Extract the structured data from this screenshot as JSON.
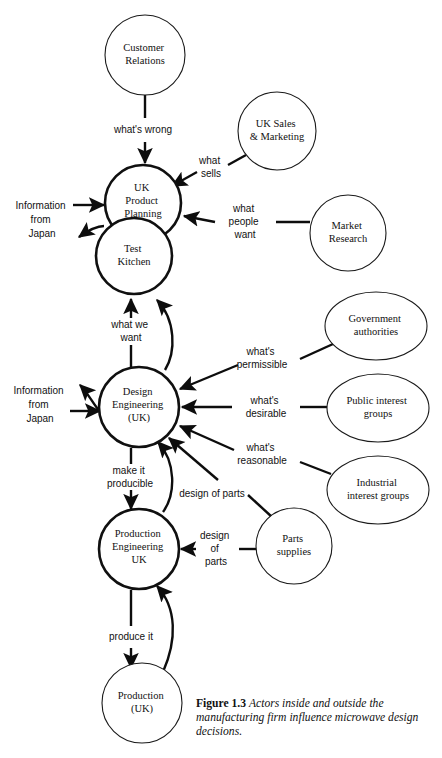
{
  "figure": {
    "label": "Figure 1.3",
    "caption": "Actors inside and outside the manufacturing firm influence microwave design decisions."
  },
  "diagram": {
    "type": "actor-influence-diagram",
    "stroke_color": "#101010",
    "background": "#ffffff",
    "internal_stroke_width": 2.6,
    "external_stroke_width": 1.1,
    "nodes": [
      {
        "id": "customer-relations",
        "label_lines": [
          "Customer",
          "Relations"
        ],
        "shape": "circle",
        "scope": "external",
        "cx": 145,
        "cy": 55,
        "r": 40
      },
      {
        "id": "uk-sales-marketing",
        "label_lines": [
          "UK Sales",
          "& Marketing"
        ],
        "shape": "circle",
        "scope": "external",
        "cx": 277,
        "cy": 131,
        "r": 39
      },
      {
        "id": "uk-product-planning",
        "label_lines": [
          "UK",
          "Product",
          "Planning"
        ],
        "shape": "circle",
        "scope": "internal",
        "cx": 143,
        "cy": 203,
        "r": 38
      },
      {
        "id": "test-kitchen",
        "label_lines": [
          "Test",
          "Kitchen"
        ],
        "shape": "circle",
        "scope": "internal",
        "cx": 134,
        "cy": 256,
        "r": 38
      },
      {
        "id": "market-research",
        "label_lines": [
          "Market",
          "Research"
        ],
        "shape": "circle",
        "scope": "external",
        "cx": 348,
        "cy": 233,
        "r": 38
      },
      {
        "id": "government-authorities",
        "label_lines": [
          "Government",
          "authorities"
        ],
        "shape": "ellipse",
        "scope": "external",
        "cx": 376,
        "cy": 326,
        "rx": 51,
        "ry": 34
      },
      {
        "id": "design-engineering-uk",
        "label_lines": [
          "Design",
          "Engineering",
          "(UK)"
        ],
        "shape": "circle",
        "scope": "internal",
        "cx": 139,
        "cy": 407,
        "r": 40
      },
      {
        "id": "public-interest-groups",
        "label_lines": [
          "Public interest",
          "groups"
        ],
        "shape": "ellipse",
        "scope": "external",
        "cx": 378,
        "cy": 408,
        "rx": 51,
        "ry": 34
      },
      {
        "id": "industrial-interest-groups",
        "label_lines": [
          "Industrial",
          "interest groups"
        ],
        "shape": "ellipse",
        "scope": "external",
        "cx": 378,
        "cy": 490,
        "rx": 51,
        "ry": 34
      },
      {
        "id": "production-engineering-uk",
        "label_lines": [
          "Production",
          "Engineering",
          "UK"
        ],
        "shape": "circle",
        "scope": "internal",
        "cx": 139,
        "cy": 549,
        "r": 40
      },
      {
        "id": "parts-supplies",
        "label_lines": [
          "Parts",
          "supplies"
        ],
        "shape": "circle",
        "scope": "external",
        "cx": 294,
        "cy": 546,
        "r": 38
      },
      {
        "id": "production-uk",
        "label_lines": [
          "Production",
          "(UK)"
        ],
        "shape": "circle",
        "scope": "external",
        "cx": 142,
        "cy": 703,
        "r": 40
      }
    ],
    "edges": [
      {
        "id": "customer-relations-to-uk-product-planning",
        "from": "customer-relations",
        "to": "uk-product-planning",
        "label": "what's wrong",
        "label_lines": [
          "what's wrong"
        ],
        "label_x": 143,
        "label_y": 130
      },
      {
        "id": "uk-sales-to-uk-product-planning",
        "from": "uk-sales-marketing",
        "to": "uk-product-planning",
        "label": "what sells",
        "label_lines": [
          "what",
          "sells"
        ],
        "label_x": 211,
        "label_y": 166
      },
      {
        "id": "market-research-to-uk-product-planning",
        "from": "market-research",
        "to": "uk-product-planning",
        "label": "what people want",
        "label_lines": [
          "what",
          "people",
          "want"
        ],
        "label_x": 245,
        "label_y": 222
      },
      {
        "id": "japan-to-uk-product-planning",
        "from": "information-from-japan",
        "to": "uk-product-planning",
        "label": "Information from Japan",
        "label_lines": [
          "Information",
          "from",
          "Japan"
        ],
        "label_x": 42,
        "label_y": 220,
        "bidirectional": true
      },
      {
        "id": "design-engineering-to-test-kitchen",
        "from": "design-engineering-uk",
        "to": "test-kitchen",
        "label": "what we want",
        "label_lines": [
          "what we",
          "want"
        ],
        "label_x": 131,
        "label_y": 325,
        "bidirectional": true
      },
      {
        "id": "government-to-design-engineering",
        "from": "government-authorities",
        "to": "design-engineering-uk",
        "label": "what's permissible",
        "label_lines": [
          "what's",
          "permissible"
        ],
        "label_x": 262,
        "label_y": 358
      },
      {
        "id": "public-interest-to-design-engineering",
        "from": "public-interest-groups",
        "to": "design-engineering-uk",
        "label": "what's desirable",
        "label_lines": [
          "what's",
          "desirable"
        ],
        "label_x": 266,
        "label_y": 407
      },
      {
        "id": "industrial-interest-to-design-engineering",
        "from": "industrial-interest-groups",
        "to": "design-engineering-uk",
        "label": "what's reasonable",
        "label_lines": [
          "what's",
          "reasonable"
        ],
        "label_x": 262,
        "label_y": 454
      },
      {
        "id": "japan-to-design-engineering",
        "from": "information-from-japan",
        "to": "design-engineering-uk",
        "label": "Information from Japan",
        "label_lines": [
          "Information",
          "from",
          "Japan"
        ],
        "label_x": 40,
        "label_y": 405,
        "bidirectional": true
      },
      {
        "id": "parts-supplies-to-design-engineering",
        "from": "parts-supplies",
        "to": "design-engineering-uk",
        "label": "design of parts",
        "label_lines": [
          "design of parts"
        ],
        "label_x": 212,
        "label_y": 494
      },
      {
        "id": "production-engineering-to-design-engineering",
        "from": "production-engineering-uk",
        "to": "design-engineering-uk",
        "label": "make it producible",
        "label_lines": [
          "make it",
          "producible"
        ],
        "label_x": 130,
        "label_y": 477,
        "bidirectional": true
      },
      {
        "id": "parts-supplies-to-production-engineering",
        "from": "parts-supplies",
        "to": "production-engineering-uk",
        "label": "design of parts",
        "label_lines": [
          "design",
          "of",
          "parts"
        ],
        "label_x": 216,
        "label_y": 549
      },
      {
        "id": "production-to-production-engineering",
        "from": "production-engineering-uk",
        "to": "production-uk",
        "label": "produce it",
        "label_lines": [
          "produce it"
        ],
        "label_x": 131,
        "label_y": 637,
        "bidirectional": true
      }
    ]
  }
}
